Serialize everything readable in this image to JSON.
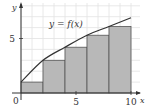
{
  "chart_data": {
    "type": "bar",
    "title": "",
    "function_label": "y = f(x)",
    "xlabel": "x",
    "ylabel": "y",
    "origin_label": "0",
    "x_ticks": [
      5,
      10
    ],
    "x_tick_labels": [
      "5",
      "10"
    ],
    "y_ticks": [
      5
    ],
    "y_tick_labels": [
      "5"
    ],
    "xlim": [
      0,
      10.8
    ],
    "ylim": [
      0,
      8.2
    ],
    "grid": true,
    "grid_step": 1,
    "curve": {
      "name": "y = f(x)",
      "x": [
        0,
        2,
        4,
        6,
        8,
        10
      ],
      "y": [
        1.0,
        3.0,
        4.2,
        5.3,
        6.1,
        6.9
      ]
    },
    "rectangles": {
      "description": "left-endpoint Riemann sum rectangles, width 2",
      "x_left": [
        0,
        2,
        4,
        6,
        8
      ],
      "width": 2,
      "heights": [
        1.0,
        3.0,
        4.2,
        5.3,
        6.1
      ]
    },
    "colors": {
      "bars": "#b8b8b8",
      "bar_edges": "#555555",
      "curve": "#333333",
      "grid": "#e2e2e2",
      "axes": "#333333"
    }
  }
}
